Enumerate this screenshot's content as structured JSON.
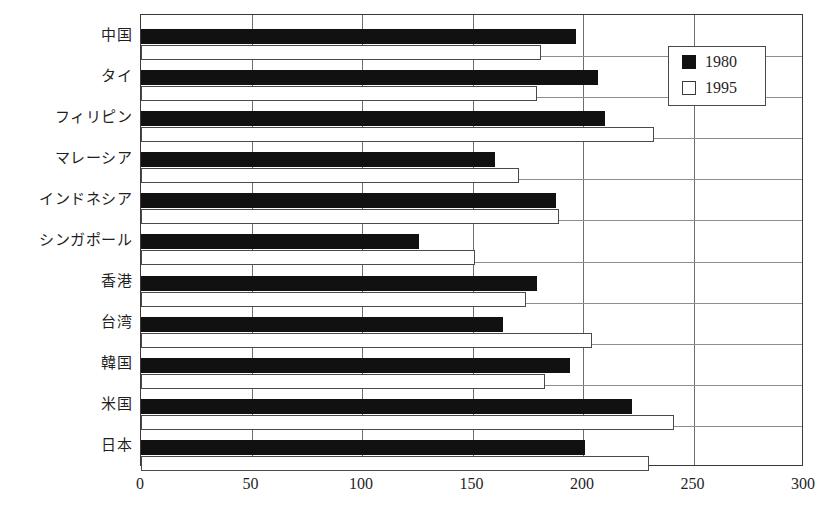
{
  "chart_data": {
    "type": "bar",
    "orientation": "horizontal",
    "title": "",
    "subtitle": "",
    "xlabel": "",
    "ylabel": "",
    "xlim": [
      0,
      300
    ],
    "xticks": [
      0,
      50,
      100,
      150,
      200,
      250,
      300
    ],
    "xtick_labels": [
      "0",
      "50",
      "100",
      "150",
      "200",
      "250",
      "300"
    ],
    "grid": true,
    "grid_axis": "x",
    "legend_position": "top-right",
    "categories": [
      "中国",
      "タイ",
      "フィリピン",
      "マレーシア",
      "インドネシア",
      "シンガポール",
      "香港",
      "台湾",
      "韓国",
      "米国",
      "日本"
    ],
    "series": [
      {
        "name": "1980",
        "color": "#111111",
        "style": "filled",
        "values": [
          197,
          207,
          210,
          160,
          188,
          126,
          179,
          164,
          194,
          222,
          201
        ]
      },
      {
        "name": "1995",
        "color": "#ffffff",
        "style": "hollow",
        "values": [
          181,
          179,
          232,
          171,
          189,
          151,
          174,
          204,
          183,
          241,
          230
        ]
      }
    ]
  },
  "legend": {
    "entries": [
      {
        "label": "1980",
        "swatch": "filled"
      },
      {
        "label": "1995",
        "swatch": "hollow"
      }
    ]
  }
}
